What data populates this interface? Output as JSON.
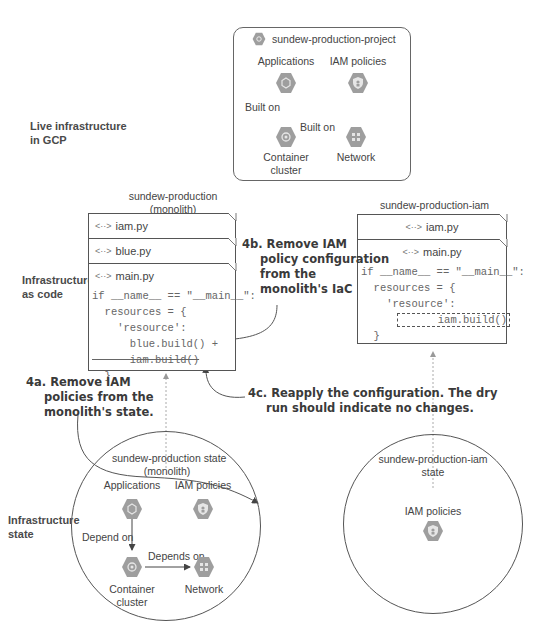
{
  "sections": {
    "live": "Live infrastructure\nin GCP",
    "code": "Infrastructure\nas code",
    "state": "Infrastructure\nstate"
  },
  "project": {
    "title": "sundew-production-project",
    "nodes": {
      "applications": "Applications",
      "iam_policies": "IAM policies",
      "container_cluster": "Container\ncluster",
      "network": "Network"
    },
    "edges": {
      "app_to_cluster": "Built on",
      "cluster_to_network": "Built on"
    }
  },
  "monolith_code": {
    "title": "sundew-production\n(monolith)",
    "files": [
      "iam.py",
      "blue.py",
      "main.py"
    ],
    "code_lines": [
      "if __name__ == \"__main__\":",
      "  resources = {",
      "    'resource':",
      "      blue.build() +",
      "      iam.build()",
      "  }"
    ],
    "struck_line_index": 4
  },
  "iam_code": {
    "title": "sundew-production-iam",
    "files": [
      "iam.py",
      "main.py"
    ],
    "code_lines": [
      "if __name__ == \"__main__\":",
      "  resources = {",
      "    'resource':",
      "      iam.build()",
      "  }"
    ]
  },
  "callouts": {
    "step_4a": {
      "head": "4a. Remove IAM",
      "rest": [
        "policies from the",
        "monolith's state."
      ]
    },
    "step_4b": {
      "head": "4b. Remove IAM",
      "rest": [
        "policy configuration",
        "from the",
        "monolith's IaC"
      ]
    },
    "step_4c": {
      "head": "4c. Reapply the configuration. The dry",
      "rest": [
        "run should indicate no changes."
      ]
    }
  },
  "monolith_state": {
    "title": "sundew-production state\n(monolith)",
    "nodes": {
      "applications": "Applications",
      "iam_policies": "IAM policies",
      "container_cluster": "Container\ncluster",
      "network": "Network"
    },
    "edges": {
      "app_to_cluster": "Depend on",
      "cluster_to_network": "Depends on"
    }
  },
  "iam_state": {
    "title": "sundew-production-iam\nstate",
    "nodes": {
      "iam_policies": "IAM policies"
    }
  },
  "colors": {
    "hex_fill": "#9e9e9e",
    "hex_inner": "#e0e0e0",
    "line": "#555555",
    "dashed": "#aaaaaa"
  }
}
